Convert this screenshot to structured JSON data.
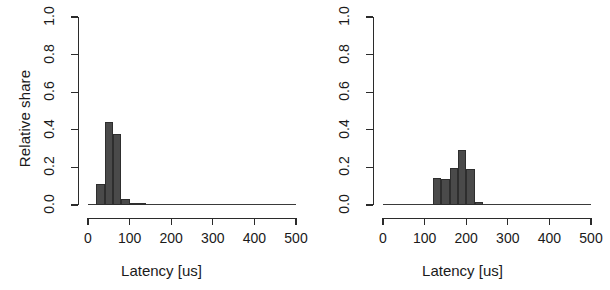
{
  "figure": {
    "background": "#ffffff",
    "bar_color": "#4a4a4a",
    "bar_border_color": "#2e2e2e",
    "axis_color": "#2b2b2b"
  },
  "chart_data": [
    {
      "type": "bar",
      "title": "",
      "subtitle": "",
      "panel": "left",
      "xlabel": "Latency [us]",
      "ylabel": "Relative share",
      "xlim": [
        0,
        500
      ],
      "ylim": [
        0.0,
        1.0
      ],
      "xticks": [
        0,
        100,
        200,
        300,
        400,
        500
      ],
      "xticklabels": [
        "0",
        "100",
        "200",
        "300",
        "400",
        "500"
      ],
      "yticks": [
        0.0,
        0.2,
        0.4,
        0.6,
        0.8,
        1.0
      ],
      "yticklabels": [
        "0.0",
        "0.2",
        "0.4",
        "0.6",
        "0.8",
        "1.0"
      ],
      "grid": false,
      "legend": null,
      "bin_width": 20,
      "bins": [
        {
          "x0": 20,
          "x1": 40,
          "value": 0.11
        },
        {
          "x0": 40,
          "x1": 60,
          "value": 0.44
        },
        {
          "x0": 60,
          "x1": 80,
          "value": 0.38
        },
        {
          "x0": 80,
          "x1": 100,
          "value": 0.03
        },
        {
          "x0": 100,
          "x1": 120,
          "value": 0.012
        },
        {
          "x0": 120,
          "x1": 140,
          "value": 0.004
        },
        {
          "x0": 140,
          "x1": 480,
          "value": 0.0
        }
      ]
    },
    {
      "type": "bar",
      "title": "",
      "subtitle": "",
      "panel": "right",
      "xlabel": "Latency [us]",
      "ylabel": "",
      "xlim": [
        0,
        500
      ],
      "ylim": [
        0.0,
        1.0
      ],
      "xticks": [
        0,
        100,
        200,
        300,
        400,
        500
      ],
      "xticklabels": [
        "0",
        "100",
        "200",
        "300",
        "400",
        "500"
      ],
      "yticks": [
        0.0,
        0.2,
        0.4,
        0.6,
        0.8,
        1.0
      ],
      "yticklabels": [
        "0.0",
        "0.2",
        "0.4",
        "0.6",
        "0.8",
        "1.0"
      ],
      "grid": false,
      "legend": null,
      "bin_width": 20,
      "bins": [
        {
          "x0": 120,
          "x1": 140,
          "value": 0.145
        },
        {
          "x0": 140,
          "x1": 160,
          "value": 0.14
        },
        {
          "x0": 160,
          "x1": 180,
          "value": 0.195
        },
        {
          "x0": 180,
          "x1": 200,
          "value": 0.29
        },
        {
          "x0": 200,
          "x1": 220,
          "value": 0.19
        },
        {
          "x0": 220,
          "x1": 240,
          "value": 0.015
        },
        {
          "x0": 240,
          "x1": 480,
          "value": 0.0
        }
      ]
    }
  ],
  "panels": [
    {
      "name": "left-histogram",
      "ylabel": "Relative share",
      "xlabel": "Latency [us]"
    },
    {
      "name": "right-histogram",
      "ylabel": "",
      "xlabel": "Latency [us]"
    }
  ]
}
